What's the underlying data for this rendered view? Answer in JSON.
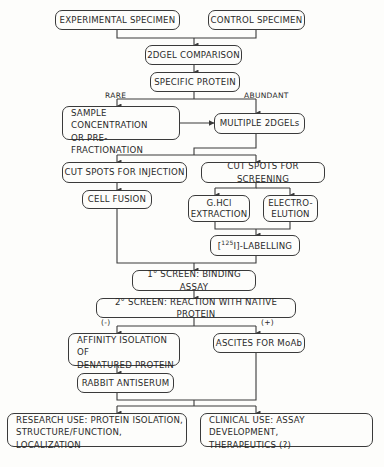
{
  "nodes": {
    "experimental": "EXPERIMENTAL SPECIMEN",
    "control": "CONTROL SPECIMEN",
    "comparison": "2DGEL COMPARISON",
    "specific": "SPECIFIC PROTEIN",
    "sample_l1": "SAMPLE CONCENTRATION",
    "sample_l2": "OR PRE-FRACTIONATION",
    "multiple": "MULTIPLE 2DGELs",
    "cut_injection": "CUT SPOTS FOR INJECTION",
    "cut_screening": "CUT SPOTS FOR SCREENING",
    "cell_fusion": "CELL FUSION",
    "ghcl_l1": "G.HCl",
    "ghcl_l2": "EXTRACTION",
    "electro_l1": "ELECTRO-",
    "electro_l2": "ELUTION",
    "labelling_pre": "[",
    "labelling_sup": "125",
    "labelling_post": "I]-LABELLING",
    "screen1": "1° SCREEN: BINDING ASSAY",
    "screen2": "2° SCREEN: REACTION WITH NATIVE PROTEIN",
    "affinity_l1": "AFFINITY ISOLATION OF",
    "affinity_l2": "DENATURED PROTEIN",
    "ascites": "ASCITES FOR MoAb",
    "rabbit": "RABBIT ANTISERUM",
    "research_l1": "RESEARCH USE: PROTEIN ISOLATION,",
    "research_l2": "STRUCTURE/FUNCTION, LOCALIZATION",
    "clinical_l1": "CLINICAL USE: ASSAY DEVELOPMENT,",
    "clinical_l2": "THERAPEUTICS (?)"
  },
  "edge_labels": {
    "rare": "RARE",
    "abundant": "ABUNDANT",
    "negative": "(-)",
    "positive": "(+)"
  }
}
